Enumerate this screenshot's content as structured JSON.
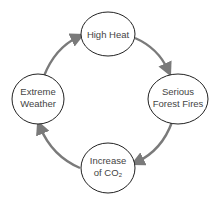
{
  "diagram": {
    "type": "cycle",
    "direction": "clockwise",
    "colors": {
      "arrow": "#7a7a7a",
      "node_stroke": "#222222",
      "node_fill": "#ffffff",
      "text": "#444444"
    },
    "nodes": [
      {
        "id": "high-heat",
        "lines": [
          "High Heat"
        ]
      },
      {
        "id": "serious-forest-fires",
        "lines": [
          "Serious",
          "Forest Fires"
        ]
      },
      {
        "id": "increase-of-co2",
        "lines": [
          "Increase",
          "of CO₂"
        ]
      },
      {
        "id": "extreme-weather",
        "lines": [
          "Extreme",
          "Weather"
        ]
      }
    ],
    "edges": [
      {
        "from": "high-heat",
        "to": "serious-forest-fires"
      },
      {
        "from": "serious-forest-fires",
        "to": "increase-of-co2"
      },
      {
        "from": "increase-of-co2",
        "to": "extreme-weather"
      },
      {
        "from": "extreme-weather",
        "to": "high-heat"
      }
    ]
  }
}
